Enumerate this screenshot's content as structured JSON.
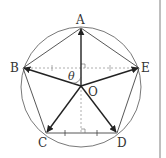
{
  "diagram": {
    "type": "regular pentagon inscribed in circle with vectors from center",
    "labels": {
      "A": "A",
      "B": "B",
      "C": "C",
      "D": "D",
      "E": "E",
      "O": "O",
      "theta": "θ"
    },
    "points": {
      "O": [
        81,
        86
      ],
      "A": [
        81,
        28
      ],
      "B": [
        23,
        68
      ],
      "C": [
        46,
        133
      ],
      "D": [
        117,
        133
      ],
      "E": [
        139,
        68
      ]
    },
    "circle": {
      "cx": 81,
      "cy": 86,
      "r": 61
    },
    "colors": {
      "line": "#444444",
      "vector": "#222222",
      "dashed": "#999999",
      "border": "#aaaaaa"
    }
  }
}
